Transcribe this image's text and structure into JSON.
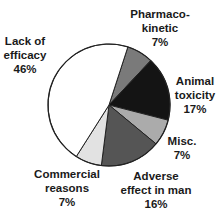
{
  "chart_data": {
    "type": "pie",
    "title": "",
    "start_angle_deg_from_north": 18,
    "direction": "clockwise",
    "center": [
      109,
      105
    ],
    "radius": 61,
    "slices": [
      {
        "name": "Pharmacokinetic",
        "label_lines": [
          "Pharmaco-",
          "kinetic",
          "7%"
        ],
        "value": 7,
        "color": "#7a7a7a",
        "label_pos": [
          160,
          7
        ]
      },
      {
        "name": "Animal toxicity",
        "label_lines": [
          "Animal",
          "toxicity",
          "17%"
        ],
        "value": 17,
        "color": "#141414",
        "label_pos": [
          195,
          74
        ]
      },
      {
        "name": "Misc.",
        "label_lines": [
          "Misc.",
          "7%"
        ],
        "value": 7,
        "color": "#ababab",
        "label_pos": [
          182,
          134
        ]
      },
      {
        "name": "Adverse effect in man",
        "label_lines": [
          "Adverse",
          "effect in man",
          "16%"
        ],
        "value": 16,
        "color": "#555555",
        "label_pos": [
          156,
          169
        ]
      },
      {
        "name": "Commercial reasons",
        "label_lines": [
          "Commercial",
          "reasons",
          "7%"
        ],
        "value": 7,
        "color": "#e2e2e2",
        "label_pos": [
          67,
          167
        ]
      },
      {
        "name": "Lack of efficacy",
        "label_lines": [
          "Lack of",
          "efficacy",
          "46%"
        ],
        "value": 46,
        "color": "#ffffff",
        "label_pos": [
          25,
          34
        ]
      }
    ]
  }
}
